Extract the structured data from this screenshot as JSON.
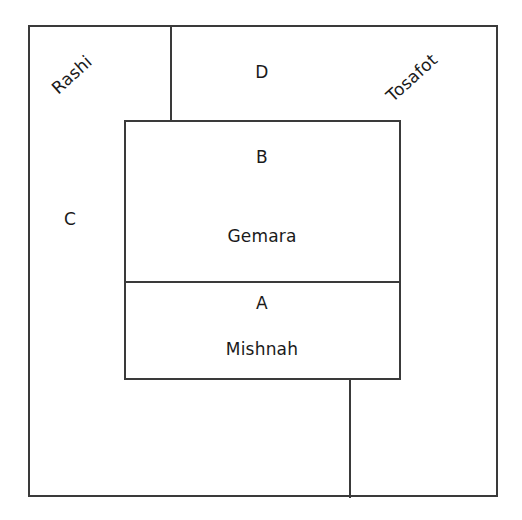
{
  "diagram": {
    "background_color": "#ffffff",
    "line_color": "#3a3a3a",
    "text_color": "#1a1a1a",
    "regions": {
      "rashi": {
        "label": "Rashi",
        "rotation_deg": -42
      },
      "tosafot": {
        "label": "Tosafot",
        "rotation_deg": -42
      },
      "d": {
        "label": "D"
      },
      "c": {
        "label": "C"
      },
      "b": {
        "label": "B"
      },
      "gemara": {
        "label": "Gemara"
      },
      "a": {
        "label": "A"
      },
      "mishnah": {
        "label": "Mishnah"
      }
    }
  }
}
